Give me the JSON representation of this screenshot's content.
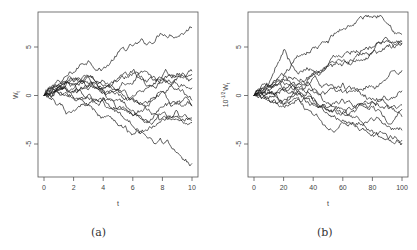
{
  "chart_data": [
    {
      "type": "line",
      "panel": "a",
      "caption": "(a)",
      "xlabel": "t",
      "ylabel": "W_t",
      "ylabel_main": "W",
      "ylabel_sub": "t",
      "xlim": [
        0,
        10
      ],
      "ylim": [
        -8.5,
        8.5
      ],
      "xticks": [
        0,
        2,
        4,
        6,
        8,
        10
      ],
      "xtick_labels": [
        "0",
        "2",
        "4",
        "6",
        "8",
        "10"
      ],
      "yticks": [
        -5,
        0,
        5
      ],
      "ytick_labels": [
        "-5",
        "0",
        "5"
      ],
      "grid": false,
      "legend": null,
      "n_series": 12,
      "series": [
        {
          "name": "path-1",
          "x": [
            0,
            1,
            2,
            3,
            4,
            5,
            6,
            7,
            8,
            9,
            10
          ],
          "values": [
            0,
            1.2,
            2.4,
            3.6,
            2.8,
            4.5,
            5.1,
            5.3,
            6.3,
            6.0,
            7.0
          ]
        },
        {
          "name": "path-2",
          "x": [
            0,
            1,
            2,
            3,
            4,
            5,
            6,
            7,
            8,
            9,
            10
          ],
          "values": [
            0,
            1.5,
            1.2,
            2.0,
            1.0,
            1.8,
            2.6,
            1.5,
            2.0,
            2.3,
            2.5
          ]
        },
        {
          "name": "path-3",
          "x": [
            0,
            1,
            2,
            3,
            4,
            5,
            6,
            7,
            8,
            9,
            10
          ],
          "values": [
            0,
            0.9,
            1.6,
            1.0,
            1.5,
            0.6,
            1.2,
            2.4,
            1.3,
            2.0,
            1.8
          ]
        },
        {
          "name": "path-4",
          "x": [
            0,
            1,
            2,
            3,
            4,
            5,
            6,
            7,
            8,
            9,
            10
          ],
          "values": [
            0,
            0.5,
            1.4,
            1.9,
            0.9,
            0.5,
            0.0,
            0.8,
            1.6,
            1.2,
            0.8
          ]
        },
        {
          "name": "path-5",
          "x": [
            0,
            1,
            2,
            3,
            4,
            5,
            6,
            7,
            8,
            9,
            10
          ],
          "values": [
            0,
            1.0,
            0.7,
            1.2,
            0.3,
            0.2,
            -0.4,
            -0.8,
            0.4,
            -0.6,
            -1.0
          ]
        },
        {
          "name": "path-6",
          "x": [
            0,
            1,
            2,
            3,
            4,
            5,
            6,
            7,
            8,
            9,
            10
          ],
          "values": [
            0,
            0.8,
            1.1,
            0.6,
            0.4,
            0.7,
            -0.2,
            -1.5,
            -2.3,
            -2.1,
            -2.8
          ]
        },
        {
          "name": "path-7",
          "x": [
            0,
            1,
            2,
            3,
            4,
            5,
            6,
            7,
            8,
            9,
            10
          ],
          "values": [
            0,
            0.6,
            0.4,
            -0.3,
            -0.6,
            -1.3,
            -2.0,
            -2.6,
            -1.8,
            -2.5,
            -2.6
          ]
        },
        {
          "name": "path-8",
          "x": [
            0,
            1,
            2,
            3,
            4,
            5,
            6,
            7,
            8,
            9,
            10
          ],
          "values": [
            0,
            0.2,
            -0.3,
            0.1,
            -0.2,
            -0.5,
            -1.5,
            -2.8,
            -1.2,
            -0.7,
            -1.1
          ]
        },
        {
          "name": "path-9",
          "x": [
            0,
            1,
            2,
            3,
            4,
            5,
            6,
            7,
            8,
            9,
            10
          ],
          "values": [
            0,
            -0.9,
            -1.5,
            -1.0,
            -0.4,
            -1.8,
            -3.2,
            -4.4,
            -4.9,
            -5.9,
            -7.0
          ]
        },
        {
          "name": "path-10",
          "x": [
            0,
            1,
            2,
            3,
            4,
            5,
            6,
            7,
            8,
            9,
            10
          ],
          "values": [
            0,
            0.3,
            -0.2,
            -0.9,
            -2.3,
            -3.1,
            -4.0,
            -3.6,
            -2.4,
            -1.6,
            -2.3
          ]
        },
        {
          "name": "path-11",
          "x": [
            0,
            1,
            2,
            3,
            4,
            5,
            6,
            7,
            8,
            9,
            10
          ],
          "values": [
            0,
            0.7,
            1.8,
            2.0,
            0.5,
            -1.4,
            -2.1,
            -1.0,
            0.4,
            1.8,
            2.2
          ]
        },
        {
          "name": "path-12",
          "x": [
            0,
            1,
            2,
            3,
            4,
            5,
            6,
            7,
            8,
            9,
            10
          ],
          "values": [
            0,
            1.1,
            0.3,
            0.9,
            0.7,
            1.5,
            2.3,
            1.0,
            1.8,
            0.6,
            -0.5
          ]
        }
      ]
    },
    {
      "type": "line",
      "panel": "b",
      "caption": "(b)",
      "xlabel": "t",
      "ylabel": "10^-1/2 W_t",
      "ylabel_prefix": "10",
      "ylabel_exp": "-1/2",
      "ylabel_main": "W",
      "ylabel_sub": "t",
      "xlim": [
        0,
        100
      ],
      "ylim": [
        -8.5,
        8.5
      ],
      "xticks": [
        0,
        20,
        40,
        60,
        80,
        100
      ],
      "xtick_labels": [
        "0",
        "20",
        "40",
        "60",
        "80",
        "100"
      ],
      "yticks": [
        -5,
        0,
        5
      ],
      "ytick_labels": [
        "-5",
        "0",
        "5"
      ],
      "grid": false,
      "legend": null,
      "n_series": 12,
      "series": [
        {
          "name": "path-1",
          "x": [
            0,
            10,
            20,
            30,
            40,
            50,
            60,
            70,
            80,
            90,
            100
          ],
          "values": [
            0,
            1.0,
            2.0,
            4.0,
            5.0,
            5.4,
            6.8,
            7.8,
            8.0,
            7.4,
            6.3
          ]
        },
        {
          "name": "path-2",
          "x": [
            0,
            10,
            20,
            30,
            40,
            50,
            60,
            70,
            80,
            90,
            100
          ],
          "values": [
            0,
            1.2,
            4.7,
            2.2,
            2.6,
            3.2,
            3.6,
            4.3,
            4.5,
            5.2,
            5.3
          ]
        },
        {
          "name": "path-3",
          "x": [
            0,
            10,
            20,
            30,
            40,
            50,
            60,
            70,
            80,
            90,
            100
          ],
          "values": [
            0,
            0.8,
            1.7,
            1.5,
            2.2,
            3.1,
            4.0,
            4.5,
            5.0,
            5.6,
            5.5
          ]
        },
        {
          "name": "path-4",
          "x": [
            0,
            10,
            20,
            30,
            40,
            50,
            60,
            70,
            80,
            90,
            100
          ],
          "values": [
            0,
            1.0,
            0.6,
            1.2,
            2.2,
            3.0,
            3.2,
            3.6,
            4.4,
            5.9,
            5.4
          ]
        },
        {
          "name": "path-5",
          "x": [
            0,
            10,
            20,
            30,
            40,
            50,
            60,
            70,
            80,
            90,
            100
          ],
          "values": [
            0,
            0.5,
            1.3,
            0.5,
            1.8,
            1.0,
            0.3,
            0.4,
            0.9,
            1.8,
            2.6
          ]
        },
        {
          "name": "path-6",
          "x": [
            0,
            10,
            20,
            30,
            40,
            50,
            60,
            70,
            80,
            90,
            100
          ],
          "values": [
            0,
            -0.3,
            0.9,
            0.2,
            0.6,
            0.5,
            1.3,
            0.7,
            -0.3,
            -0.4,
            0.5
          ]
        },
        {
          "name": "path-7",
          "x": [
            0,
            10,
            20,
            30,
            40,
            50,
            60,
            70,
            80,
            90,
            100
          ],
          "values": [
            0,
            0.2,
            -0.5,
            0.9,
            -0.6,
            -1.2,
            -0.4,
            -0.9,
            -0.7,
            -1.0,
            -1.0
          ]
        },
        {
          "name": "path-8",
          "x": [
            0,
            10,
            20,
            30,
            40,
            50,
            60,
            70,
            80,
            90,
            100
          ],
          "values": [
            0,
            0.6,
            -1.0,
            0.4,
            -0.8,
            -1.5,
            -1.8,
            -1.2,
            -0.6,
            -1.0,
            -2.2
          ]
        },
        {
          "name": "path-9",
          "x": [
            0,
            10,
            20,
            30,
            40,
            50,
            60,
            70,
            80,
            90,
            100
          ],
          "values": [
            0,
            -0.4,
            -0.9,
            -0.2,
            -2.0,
            -3.5,
            -2.8,
            -3.0,
            -2.4,
            -3.2,
            -3.6
          ]
        },
        {
          "name": "path-10",
          "x": [
            0,
            10,
            20,
            30,
            40,
            50,
            60,
            70,
            80,
            90,
            100
          ],
          "values": [
            0,
            0.3,
            0.5,
            0.2,
            -1.0,
            -1.9,
            -2.5,
            -3.3,
            -4.0,
            -4.2,
            -4.9
          ]
        },
        {
          "name": "path-11",
          "x": [
            0,
            10,
            20,
            30,
            40,
            50,
            60,
            70,
            80,
            90,
            100
          ],
          "values": [
            0,
            0.9,
            1.9,
            1.2,
            0.4,
            -0.7,
            -1.4,
            -2.2,
            -3.6,
            -4.5,
            -4.6
          ]
        },
        {
          "name": "path-12",
          "x": [
            0,
            10,
            20,
            30,
            40,
            50,
            60,
            70,
            80,
            90,
            100
          ],
          "values": [
            0,
            -0.5,
            -1.1,
            -0.4,
            -0.2,
            -1.4,
            -1.7,
            -0.9,
            -1.2,
            -2.8,
            -1.4
          ]
        }
      ]
    }
  ],
  "captions": {
    "a": "(a)",
    "b": "(b)"
  }
}
